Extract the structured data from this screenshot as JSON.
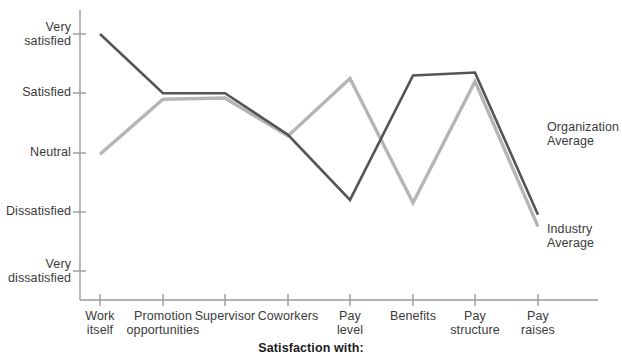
{
  "chart_data": {
    "type": "line",
    "title": "",
    "xlabel": "Satisfaction with:",
    "ylabel": "",
    "grid": false,
    "legend_position": "right-inline",
    "categories": [
      "Work\nitself",
      "Promotion\nopportunities",
      "Supervisor",
      "Coworkers",
      "Pay\nlevel",
      "Benefits",
      "Pay\nstructure",
      "Pay\nraises"
    ],
    "ytick_labels": [
      "Very\nsatisfied",
      "Satisfied",
      "Neutral",
      "Dissatisfied",
      "Very\ndissatisfied"
    ],
    "yticks": [
      5,
      4,
      3,
      2,
      1
    ],
    "ylim": [
      1,
      5
    ],
    "series": [
      {
        "name": "Organization\nAverage",
        "color": "#555555",
        "values": [
          5.0,
          4.0,
          4.0,
          3.3,
          2.2,
          4.3,
          4.35,
          1.95
        ]
      },
      {
        "name": "Industry\nAverage",
        "color": "#b5b5b5",
        "values": [
          2.97,
          3.9,
          3.92,
          3.28,
          4.25,
          2.15,
          4.2,
          1.75
        ]
      }
    ]
  },
  "axis": {
    "bottom_title": "Satisfaction with:"
  },
  "yaxis": {
    "labels": [
      {
        "line1": "Very",
        "line2": "satisfied"
      },
      {
        "line1": "Satisfied",
        "line2": ""
      },
      {
        "line1": "Neutral",
        "line2": ""
      },
      {
        "line1": "Dissatisfied",
        "line2": ""
      },
      {
        "line1": "Very",
        "line2": "dissatisfied"
      }
    ]
  },
  "xaxis": {
    "labels": [
      {
        "line1": "Work",
        "line2": "itself"
      },
      {
        "line1": "Promotion",
        "line2": "opportunities"
      },
      {
        "line1": "Supervisor",
        "line2": ""
      },
      {
        "line1": "Coworkers",
        "line2": ""
      },
      {
        "line1": "Pay",
        "line2": "level"
      },
      {
        "line1": "Benefits",
        "line2": ""
      },
      {
        "line1": "Pay",
        "line2": "structure"
      },
      {
        "line1": "Pay",
        "line2": "raises"
      }
    ]
  },
  "legend": {
    "organization": {
      "line1": "Organization",
      "line2": "Average"
    },
    "industry": {
      "line1": "Industry",
      "line2": "Average"
    }
  },
  "colors": {
    "organization_line": "#555555",
    "industry_line": "#b5b5b5",
    "axis": "#9a9a9a",
    "text": "#3a3a3a"
  }
}
